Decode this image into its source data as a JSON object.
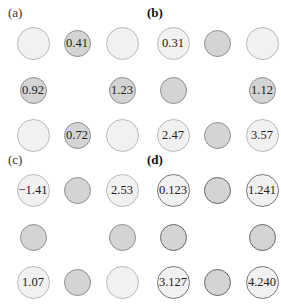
{
  "panels": [
    {
      "label": "(a)",
      "bold": false,
      "cells": [
        {
          "row": 0,
          "col": 0,
          "type": "light",
          "text": ""
        },
        {
          "row": 0,
          "col": 1,
          "type": "dark",
          "text": "0.41"
        },
        {
          "row": 0,
          "col": 2,
          "type": "light",
          "text": ""
        },
        {
          "row": 1,
          "col": 0,
          "type": "dark",
          "text": "0.92"
        },
        {
          "row": 1,
          "col": 2,
          "type": "dark",
          "text": "1.23"
        },
        {
          "row": 2,
          "col": 0,
          "type": "light",
          "text": ""
        },
        {
          "row": 2,
          "col": 1,
          "type": "dark",
          "text": "0.72"
        },
        {
          "row": 2,
          "col": 2,
          "type": "light",
          "text": ""
        }
      ]
    },
    {
      "label": "(b)",
      "bold": true,
      "cells": [
        {
          "row": 0,
          "col": 0,
          "type": "light",
          "text": "0.31"
        },
        {
          "row": 0,
          "col": 1,
          "type": "dark",
          "text": ""
        },
        {
          "row": 0,
          "col": 2,
          "type": "light",
          "text": ""
        },
        {
          "row": 1,
          "col": 0,
          "type": "dark",
          "text": ""
        },
        {
          "row": 1,
          "col": 2,
          "type": "dark",
          "text": "1.12"
        },
        {
          "row": 2,
          "col": 0,
          "type": "light",
          "text": "2.47"
        },
        {
          "row": 2,
          "col": 1,
          "type": "dark",
          "text": ""
        },
        {
          "row": 2,
          "col": 2,
          "type": "light",
          "text": "3.57"
        }
      ]
    },
    {
      "label": "(c)",
      "bold": false,
      "cells": [
        {
          "row": 0,
          "col": 0,
          "type": "light",
          "text": "−1.41"
        },
        {
          "row": 0,
          "col": 1,
          "type": "dark",
          "text": ""
        },
        {
          "row": 0,
          "col": 2,
          "type": "light",
          "text": "2.53"
        },
        {
          "row": 1,
          "col": 0,
          "type": "dark",
          "text": ""
        },
        {
          "row": 1,
          "col": 2,
          "type": "dark",
          "text": ""
        },
        {
          "row": 2,
          "col": 0,
          "type": "light",
          "text": "1.07"
        },
        {
          "row": 2,
          "col": 1,
          "type": "dark",
          "text": ""
        },
        {
          "row": 2,
          "col": 2,
          "type": "light",
          "text": ""
        }
      ]
    },
    {
      "label": "(d)",
      "bold": true,
      "outline": true,
      "cells": [
        {
          "row": 0,
          "col": 0,
          "type": "light",
          "text": "0.123"
        },
        {
          "row": 0,
          "col": 1,
          "type": "dark",
          "text": ""
        },
        {
          "row": 0,
          "col": 2,
          "type": "light",
          "text": "1.241"
        },
        {
          "row": 1,
          "col": 0,
          "type": "dark",
          "text": ""
        },
        {
          "row": 1,
          "col": 2,
          "type": "dark",
          "text": ""
        },
        {
          "row": 2,
          "col": 0,
          "type": "light",
          "text": "3.127"
        },
        {
          "row": 2,
          "col": 1,
          "type": "dark",
          "text": ""
        },
        {
          "row": 2,
          "col": 2,
          "type": "light",
          "text": "4.240"
        }
      ]
    }
  ]
}
